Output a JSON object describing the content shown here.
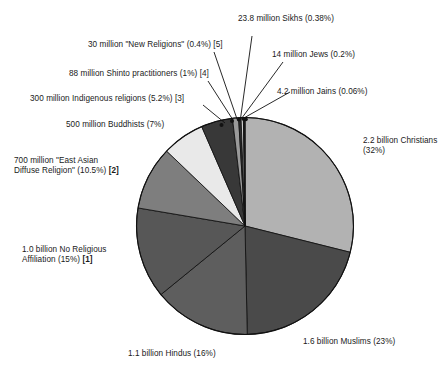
{
  "chart_data": {
    "type": "pie",
    "title": "",
    "subtitle": "",
    "xlabel": "",
    "ylabel": "",
    "legend_position": "callout-labels",
    "grid": false,
    "total_note": "",
    "categories": [
      "Christians",
      "Muslims",
      "Hindus",
      "No Religious Affiliation",
      "East Asian Diffuse Religion",
      "Buddhists",
      "Indigenous religions",
      "Shinto practitioners",
      "New Religions",
      "Sikhs",
      "Jews",
      "Jains"
    ],
    "values": [
      32,
      23,
      16,
      15,
      10.5,
      7,
      5.2,
      1,
      0.4,
      0.38,
      0.2,
      0.06
    ],
    "slices": [
      {
        "key": "christians",
        "label": "2.2 billion Christians",
        "label_line1": "2.2 billion Christians",
        "label_line2": "(32%)",
        "count_text": "2.2 billion",
        "percent": 32,
        "percent_text": "(32%)",
        "footnote": "",
        "color": "#b2b2b2"
      },
      {
        "key": "muslims",
        "label": "1.6 billion Muslims (23%)",
        "count_text": "1.6 billion",
        "percent": 23,
        "percent_text": "(23%)",
        "footnote": "",
        "color": "#4a4a4a"
      },
      {
        "key": "hindus",
        "label": "1.1 billion Hindus (16%)",
        "count_text": "1.1 billion",
        "percent": 16,
        "percent_text": "(16%)",
        "footnote": "",
        "color": "#5e5e5e"
      },
      {
        "key": "no-religious-affiliation",
        "label": "1.0 billion No Religious Affiliation (15%) [1]",
        "label_line1": "1.0 billion No Religious",
        "label_line2": "Affiliation (15%)",
        "count_text": "1.0 billion",
        "percent": 15,
        "percent_text": "(15%)",
        "footnote": "[1]",
        "color": "#575757"
      },
      {
        "key": "east-asian-diffuse-religion",
        "label": "700 million \"East Asian Diffuse Religion\" (10.5%) [2]",
        "label_line1": "700 million \"East Asian",
        "label_line2": "Diffuse Religion\" (10.5%)",
        "count_text": "700 million",
        "percent": 10.5,
        "percent_text": "(10.5%)",
        "footnote": "[2]",
        "color": "#7e7e7e"
      },
      {
        "key": "buddhists",
        "label": "500 million Buddhists (7%)",
        "count_text": "500 million",
        "percent": 7,
        "percent_text": "(7%)",
        "footnote": "",
        "color": "#e9e9e9"
      },
      {
        "key": "indigenous-religions",
        "label": "300 million Indigenous religions (5.2%) [3]",
        "count_text": "300 million",
        "percent": 5.2,
        "percent_text": "(5.2%)",
        "footnote": "[3]",
        "color": "#383838"
      },
      {
        "key": "shinto-practitioners",
        "label": "88 million Shinto practitioners (1%) [4]",
        "count_text": "88 million",
        "percent": 1,
        "percent_text": "(1%)",
        "footnote": "[4]",
        "color": "#9a9a9a"
      },
      {
        "key": "new-religions",
        "label": "30 million \"New Religions\" (0.4%) [5]",
        "count_text": "30 million",
        "percent": 0.4,
        "percent_text": "(0.4%)",
        "footnote": "[5]",
        "color": "#2e2e2e"
      },
      {
        "key": "sikhs",
        "label": "23.8 million Sikhs (0.38%)",
        "count_text": "23.8 million",
        "percent": 0.38,
        "percent_text": "(0.38%)",
        "footnote": "",
        "color": "#cfcfcf"
      },
      {
        "key": "jews",
        "label": "14 million Jews (0.2%)",
        "count_text": "14 million",
        "percent": 0.2,
        "percent_text": "(0.2%)",
        "footnote": "",
        "color": "#2e2e2e"
      },
      {
        "key": "jains",
        "label": "4.2 million Jains (0.06%)",
        "count_text": "4.2 million",
        "percent": 0.06,
        "percent_text": "(0.06%)",
        "footnote": "",
        "color": "#8c8c8c"
      }
    ]
  }
}
